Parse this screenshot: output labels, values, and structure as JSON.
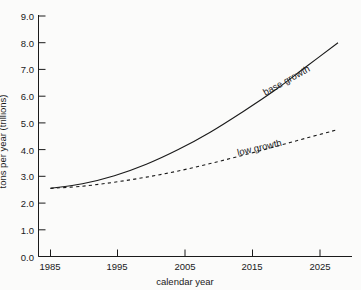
{
  "chart_data": {
    "type": "line",
    "title": "",
    "subtitle": "",
    "xlabel": "calendar year",
    "ylabel": "tons per year (trillions)",
    "xlim": [
      1985,
      2030
    ],
    "ylim": [
      0.0,
      9.0
    ],
    "xticks": [
      1985,
      1995,
      2005,
      2015,
      2025
    ],
    "xtick_labels": [
      "1985",
      "1995",
      "2005",
      "2015",
      "2025"
    ],
    "yticks": [
      0.0,
      1.0,
      2.0,
      3.0,
      4.0,
      5.0,
      6.0,
      7.0,
      8.0,
      9.0
    ],
    "ytick_labels": [
      "0.0",
      "1.0",
      "2.0",
      "3.0",
      "4.0",
      "5.0",
      "6.0",
      "7.0",
      "8.0",
      "9.0"
    ],
    "grid": false,
    "legend": "inline-annotations",
    "x": [
      1985,
      1990,
      1995,
      2000,
      2005,
      2010,
      2015,
      2020,
      2025,
      2030
    ],
    "series": [
      {
        "name": "base growth",
        "style": "solid",
        "color": "#1a1a1a",
        "values": [
          2.55,
          2.72,
          3.02,
          3.45,
          4.0,
          4.65,
          5.4,
          6.2,
          7.1,
          8.0
        ]
      },
      {
        "name": "low growth",
        "style": "dashed",
        "color": "#1a1a1a",
        "values": [
          2.55,
          2.63,
          2.78,
          2.97,
          3.2,
          3.48,
          3.78,
          4.1,
          4.43,
          4.75
        ]
      }
    ],
    "annotations": [
      {
        "text": "base growth",
        "x": 2018,
        "y": 6.3,
        "rotation": -29
      },
      {
        "text": "low growth",
        "x": 2014,
        "y": 4.1,
        "rotation": -13
      }
    ]
  }
}
